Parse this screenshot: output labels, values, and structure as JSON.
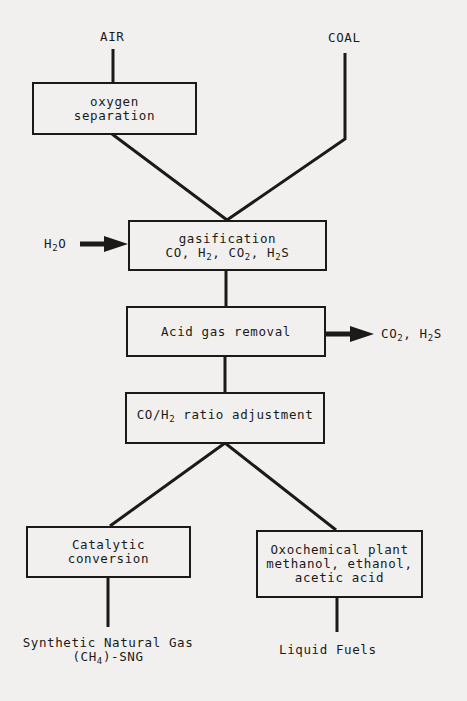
{
  "diagram": {
    "type": "process-flowchart",
    "inputs": {
      "air": "AIR",
      "coal": "COAL",
      "water": {
        "base": "H",
        "sub": "2",
        "tail": "O"
      }
    },
    "nodes": {
      "oxygen_separation": {
        "line1": "oxygen",
        "line2": "separation"
      },
      "gasification": {
        "title": "gasification",
        "products": [
          {
            "base": "CO",
            "sub": ""
          },
          {
            "base": "H",
            "sub": "2"
          },
          {
            "base": "CO",
            "sub": "2"
          },
          {
            "base": "H",
            "sub": "2",
            "tail": "S"
          }
        ]
      },
      "acid_gas_removal": {
        "label": "Acid gas removal"
      },
      "ratio_adjustment": {
        "pre": "CO/H",
        "sub": "2",
        "post": " ratio adjustment"
      },
      "catalytic_conversion": {
        "line1": "Catalytic",
        "line2": "conversion"
      },
      "oxochemical_plant": {
        "line1": "Oxochemical plant",
        "line2": "methanol, ethanol,",
        "line3": "acetic acid"
      }
    },
    "byproducts": {
      "acid_gases": {
        "co2_base": "CO",
        "co2_sub": "2",
        "sep": ", ",
        "h2s_base": "H",
        "h2s_sub": "2",
        "h2s_tail": "S"
      }
    },
    "outputs": {
      "sng": {
        "line1": "Synthetic Natural Gas",
        "line2_pre": "(CH",
        "line2_sub": "4",
        "line2_post": ")-SNG"
      },
      "liquid_fuels": "Liquid Fuels"
    },
    "colors": {
      "line": "#1a1a1a",
      "background": "#f1f0ee"
    }
  }
}
